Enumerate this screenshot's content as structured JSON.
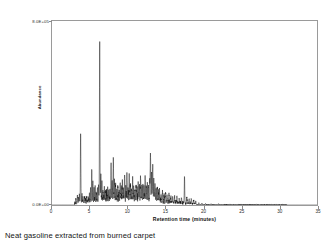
{
  "caption": "Neat gasoline extracted from burned carpet",
  "axis": {
    "y_title": "Abundance",
    "y_top_label": "8.0E+05",
    "y_bottom_label": "0.0E+00",
    "x_title": "Retention time (minutes)"
  },
  "chart_data": {
    "type": "line",
    "title": "Neat gasoline extracted from burned carpet",
    "xlabel": "Retention time (minutes)",
    "ylabel": "Abundance",
    "xlim": [
      0,
      35
    ],
    "ylim": [
      0,
      800000
    ],
    "xticks": [
      0,
      5,
      10,
      15,
      20,
      25,
      30,
      35
    ],
    "yticks": [
      0,
      800000
    ],
    "ytick_labels": [
      "0.0E+00",
      "8.0E+05"
    ],
    "grid": false,
    "legend": "none",
    "line_color": "#000000",
    "series_name": "Total ion chromatogram",
    "baseline_start": 3.0,
    "baseline_end": 31.0,
    "peaks": [
      {
        "rt": 3.15,
        "height": 18000
      },
      {
        "rt": 3.35,
        "height": 32000
      },
      {
        "rt": 3.5,
        "height": 26000
      },
      {
        "rt": 3.62,
        "height": 45000
      },
      {
        "rt": 3.78,
        "height": 300000
      },
      {
        "rt": 3.95,
        "height": 38000
      },
      {
        "rt": 4.1,
        "height": 22000
      },
      {
        "rt": 4.3,
        "height": 30000
      },
      {
        "rt": 4.45,
        "height": 18000
      },
      {
        "rt": 4.6,
        "height": 25000
      },
      {
        "rt": 4.8,
        "height": 20000
      },
      {
        "rt": 4.95,
        "height": 34000
      },
      {
        "rt": 5.1,
        "height": 60000
      },
      {
        "rt": 5.25,
        "height": 150000
      },
      {
        "rt": 5.4,
        "height": 90000
      },
      {
        "rt": 5.55,
        "height": 55000
      },
      {
        "rt": 5.7,
        "height": 70000
      },
      {
        "rt": 5.85,
        "height": 45000
      },
      {
        "rt": 6.0,
        "height": 62000
      },
      {
        "rt": 6.15,
        "height": 80000
      },
      {
        "rt": 6.3,
        "height": 690000
      },
      {
        "rt": 6.45,
        "height": 120000
      },
      {
        "rt": 6.6,
        "height": 70000
      },
      {
        "rt": 6.75,
        "height": 50000
      },
      {
        "rt": 6.9,
        "height": 62000
      },
      {
        "rt": 7.05,
        "height": 44000
      },
      {
        "rt": 7.2,
        "height": 38000
      },
      {
        "rt": 7.35,
        "height": 52000
      },
      {
        "rt": 7.5,
        "height": 35000
      },
      {
        "rt": 7.65,
        "height": 40000
      },
      {
        "rt": 7.8,
        "height": 150000
      },
      {
        "rt": 7.95,
        "height": 95000
      },
      {
        "rt": 8.1,
        "height": 175000
      },
      {
        "rt": 8.25,
        "height": 85000
      },
      {
        "rt": 8.4,
        "height": 60000
      },
      {
        "rt": 8.55,
        "height": 48000
      },
      {
        "rt": 8.7,
        "height": 55000
      },
      {
        "rt": 8.85,
        "height": 42000
      },
      {
        "rt": 9.0,
        "height": 68000
      },
      {
        "rt": 9.15,
        "height": 50000
      },
      {
        "rt": 9.3,
        "height": 80000
      },
      {
        "rt": 9.45,
        "height": 58000
      },
      {
        "rt": 9.6,
        "height": 120000
      },
      {
        "rt": 9.75,
        "height": 70000
      },
      {
        "rt": 9.9,
        "height": 95000
      },
      {
        "rt": 10.05,
        "height": 62000
      },
      {
        "rt": 10.2,
        "height": 110000
      },
      {
        "rt": 10.35,
        "height": 72000
      },
      {
        "rt": 10.5,
        "height": 55000
      },
      {
        "rt": 10.65,
        "height": 85000
      },
      {
        "rt": 10.8,
        "height": 60000
      },
      {
        "rt": 10.95,
        "height": 48000
      },
      {
        "rt": 11.1,
        "height": 66000
      },
      {
        "rt": 11.25,
        "height": 52000
      },
      {
        "rt": 11.4,
        "height": 75000
      },
      {
        "rt": 11.55,
        "height": 58000
      },
      {
        "rt": 11.7,
        "height": 95000
      },
      {
        "rt": 11.85,
        "height": 62000
      },
      {
        "rt": 12.0,
        "height": 70000
      },
      {
        "rt": 12.15,
        "height": 48000
      },
      {
        "rt": 12.3,
        "height": 105000
      },
      {
        "rt": 12.45,
        "height": 64000
      },
      {
        "rt": 12.6,
        "height": 72000
      },
      {
        "rt": 12.75,
        "height": 55000
      },
      {
        "rt": 12.9,
        "height": 88000
      },
      {
        "rt": 13.0,
        "height": 215000
      },
      {
        "rt": 13.15,
        "height": 120000
      },
      {
        "rt": 13.3,
        "height": 160000
      },
      {
        "rt": 13.45,
        "height": 90000
      },
      {
        "rt": 13.6,
        "height": 70000
      },
      {
        "rt": 13.75,
        "height": 55000
      },
      {
        "rt": 13.9,
        "height": 62000
      },
      {
        "rt": 14.05,
        "height": 45000
      },
      {
        "rt": 14.2,
        "height": 52000
      },
      {
        "rt": 14.4,
        "height": 38000
      },
      {
        "rt": 14.6,
        "height": 44000
      },
      {
        "rt": 14.8,
        "height": 32000
      },
      {
        "rt": 15.0,
        "height": 40000
      },
      {
        "rt": 15.2,
        "height": 28000
      },
      {
        "rt": 15.45,
        "height": 34000
      },
      {
        "rt": 15.7,
        "height": 24000
      },
      {
        "rt": 15.95,
        "height": 30000
      },
      {
        "rt": 16.2,
        "height": 22000
      },
      {
        "rt": 16.5,
        "height": 26000
      },
      {
        "rt": 16.8,
        "height": 18000
      },
      {
        "rt": 17.1,
        "height": 22000
      },
      {
        "rt": 17.5,
        "height": 115000
      },
      {
        "rt": 17.8,
        "height": 26000
      },
      {
        "rt": 18.1,
        "height": 18000
      },
      {
        "rt": 18.4,
        "height": 22000
      },
      {
        "rt": 18.7,
        "height": 14000
      },
      {
        "rt": 19.0,
        "height": 12000
      },
      {
        "rt": 19.4,
        "height": 9000
      },
      {
        "rt": 19.8,
        "height": 7000
      },
      {
        "rt": 20.3,
        "height": 5000
      },
      {
        "rt": 21.0,
        "height": 4000
      },
      {
        "rt": 22.0,
        "height": 3500
      },
      {
        "rt": 23.5,
        "height": 3000
      },
      {
        "rt": 25.0,
        "height": 2800
      },
      {
        "rt": 27.0,
        "height": 2500
      },
      {
        "rt": 29.0,
        "height": 2200
      },
      {
        "rt": 30.5,
        "height": 2000
      }
    ]
  }
}
